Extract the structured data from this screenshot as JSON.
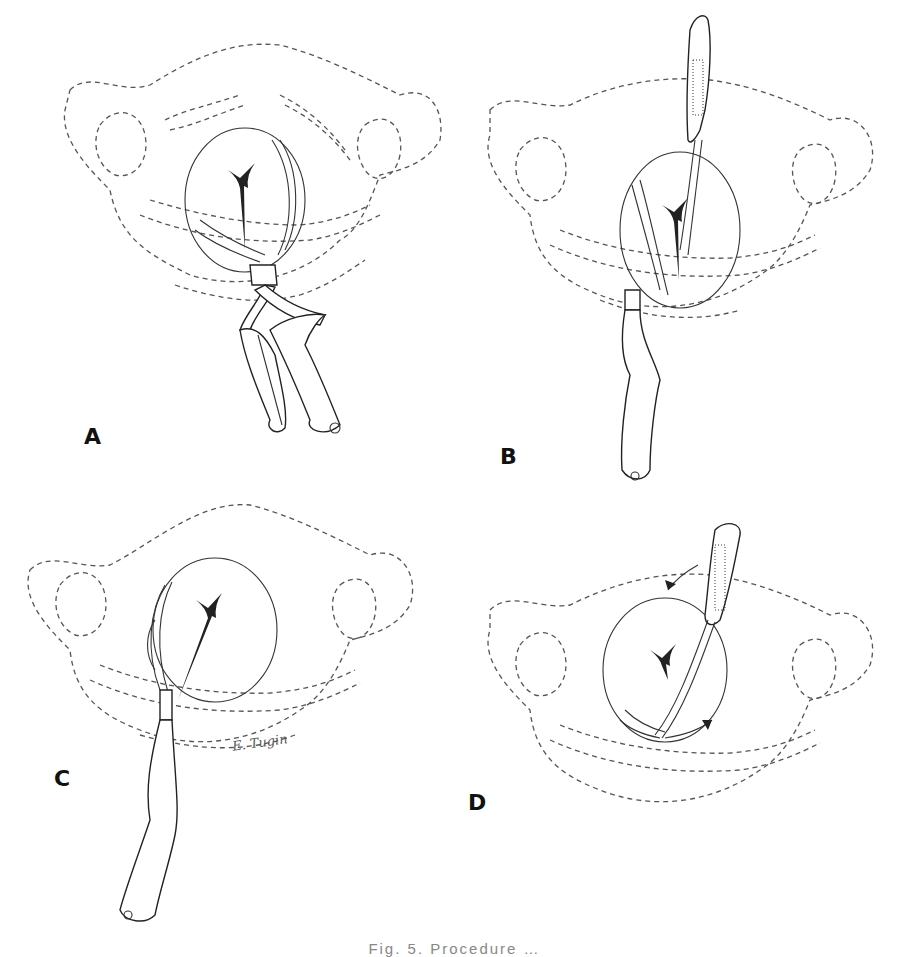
{
  "figure": {
    "panels": [
      {
        "id": "A",
        "label": "A",
        "description": "Pelvic outline with first forceps blade applied, handles crossed below"
      },
      {
        "id": "B",
        "label": "B",
        "description": "Second blade inserted, handle elevated upward"
      },
      {
        "id": "C",
        "label": "C",
        "description": "Single blade applied along side of fetal head, handle pointing down-left"
      },
      {
        "id": "D",
        "label": "D",
        "description": "Blade rotation (wandering) with curved arrows indicating direction"
      }
    ],
    "signature": "E. Tugin",
    "caption": "Fig. 5. Procedure …"
  }
}
